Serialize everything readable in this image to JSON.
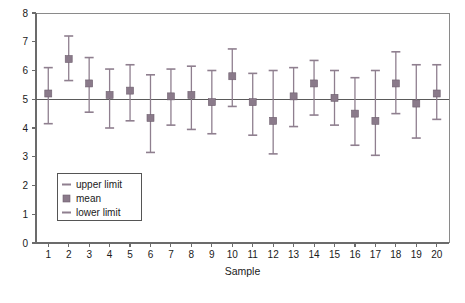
{
  "chart_data": {
    "type": "scatter",
    "title": "",
    "xlabel": "Sample",
    "ylabel": "",
    "xlim": [
      0.4,
      20.6
    ],
    "ylim": [
      0,
      8
    ],
    "grid": false,
    "center_line": 5.0,
    "legend_position": "lower-left-inside",
    "categories": [
      "1",
      "2",
      "3",
      "4",
      "5",
      "6",
      "7",
      "8",
      "9",
      "10",
      "11",
      "12",
      "13",
      "14",
      "15",
      "16",
      "17",
      "18",
      "19",
      "20"
    ],
    "x": [
      1,
      2,
      3,
      4,
      5,
      6,
      7,
      8,
      9,
      10,
      11,
      12,
      13,
      14,
      15,
      16,
      17,
      18,
      19,
      20
    ],
    "series": [
      {
        "name": "mean",
        "values": [
          5.2,
          6.4,
          5.55,
          5.15,
          5.3,
          4.35,
          5.1,
          5.15,
          4.9,
          5.8,
          4.9,
          4.25,
          5.1,
          5.55,
          5.05,
          4.5,
          4.25,
          5.55,
          4.85,
          5.2
        ]
      },
      {
        "name": "upper limit",
        "values": [
          6.1,
          7.2,
          6.45,
          6.05,
          6.2,
          5.85,
          6.05,
          6.15,
          6.0,
          6.75,
          5.9,
          6.0,
          6.1,
          6.35,
          6.0,
          5.75,
          6.0,
          6.65,
          6.2,
          6.2
        ]
      },
      {
        "name": "lower limit",
        "values": [
          4.15,
          5.65,
          4.55,
          4.0,
          4.25,
          3.15,
          4.1,
          3.95,
          3.8,
          4.75,
          3.75,
          3.1,
          4.05,
          4.45,
          4.1,
          3.4,
          3.05,
          4.5,
          3.65,
          4.3
        ]
      }
    ],
    "y_ticks": [
      0,
      1,
      2,
      3,
      4,
      5,
      6,
      7,
      8
    ],
    "colors": {
      "mean": "#8a7a8a",
      "limits": "#8f7f8f",
      "axis": "#6b6b6b",
      "center_line": "#5a5a5a",
      "background": "#ffffff"
    }
  },
  "legend": {
    "entries": [
      {
        "label": "upper limit",
        "icon": "dash-icon"
      },
      {
        "label": "mean",
        "icon": "square-marker-icon"
      },
      {
        "label": "lower limit",
        "icon": "dash-icon"
      }
    ]
  },
  "axes": {
    "x_title": "Sample",
    "y_tick_labels": [
      "0",
      "1",
      "2",
      "3",
      "4",
      "5",
      "6",
      "7",
      "8"
    ],
    "x_tick_labels": [
      "1",
      "2",
      "3",
      "4",
      "5",
      "6",
      "7",
      "8",
      "9",
      "10",
      "11",
      "12",
      "13",
      "14",
      "15",
      "16",
      "17",
      "18",
      "19",
      "20"
    ]
  }
}
